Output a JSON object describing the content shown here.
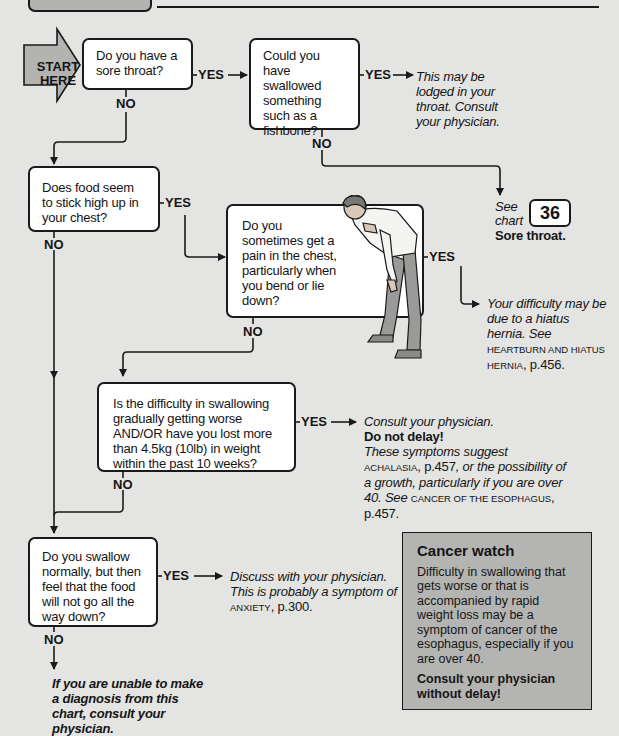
{
  "header": {
    "tab_text": "",
    "subtitle": ""
  },
  "start": {
    "line1": "START",
    "line2": "HERE"
  },
  "nodes": {
    "q1": "Do you have a sore throat?",
    "q2": "Could you have swallowed something such as a fishbone?",
    "q3": "Does food seem to stick high up in your chest?",
    "q4": "Do you sometimes get a pain in the chest, particularly when you bend or lie down?",
    "q5": "Is the difficulty in swallowing gradually getting worse AND/OR have you lost more than 4.5kg (10lb) in weight within the past 10 weeks?",
    "q6": "Do you swallow normally, but then feel that the food will not go all the way down?"
  },
  "labels": {
    "yes": "YES",
    "no": "NO"
  },
  "outcomes": {
    "fishbone": "This may be lodged in your throat. Consult your physician.",
    "see_chart": {
      "see": "See",
      "chart": "chart",
      "number": "36",
      "title": "Sore throat."
    },
    "hernia": {
      "text": "Your difficulty may be due to a hiatus hernia. See",
      "ref": "HEARTBURN AND HIATUS HERNIA",
      "page": ", p.456."
    },
    "consult": {
      "line1": "Consult your physician.",
      "line2": "Do not delay!",
      "line3": "These symptoms suggest",
      "ref1": "ACHALASIA",
      "page1": ", p.457",
      "text2": ", or the possibility of a growth, particularly if you are over 40. See",
      "ref2": "CANCER OF THE ESOPHAGUS",
      "page2": ", p.457."
    },
    "anxiety": {
      "text": "Discuss with your physician. This is probably a symptom of",
      "ref": "ANXIETY",
      "page": ", p.300."
    },
    "final": "If you are unable to make a diagnosis from this chart, consult your physician."
  },
  "cancer_watch": {
    "title": "Cancer watch",
    "body": "Difficulty in swallowing that gets worse or that is accompanied by rapid weight loss may be a symptom of cancer of the esophagus, especially if you are over 40.",
    "emphasis": "Consult your physician without delay!"
  },
  "illustration": {
    "subject": "man-bending-with-chest-pain"
  },
  "colors": {
    "background": "#e4e4e2",
    "panel": "#b4b4b2",
    "box": "#ffffff",
    "ink": "#1a1a1a",
    "arrow_fill": "#b3b3b1"
  }
}
